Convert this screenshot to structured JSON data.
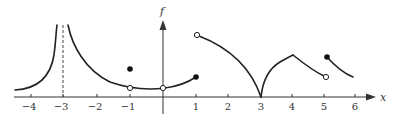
{
  "figure": {
    "function_label": "f",
    "x_axis_label": "x",
    "colors": {
      "curve": "#222222",
      "axis": "#333333",
      "asymptote": "#444444",
      "open_dot_fill": "#ffffff"
    }
  },
  "axis": {
    "x_ticks": [
      "−4",
      "−3",
      "−2",
      "−1",
      "1",
      "2",
      "3",
      "4",
      "5",
      "6"
    ],
    "x_range": [
      -4.5,
      6.8
    ]
  },
  "graph": {
    "vertical_asymptote": {
      "x": -3,
      "style": "dashed"
    },
    "points": [
      {
        "x": -1,
        "type": "open",
        "description": "hole on curve at x=-1"
      },
      {
        "x": -1,
        "type": "filled",
        "description": "defined value above curve at x=-1"
      },
      {
        "x": 0,
        "type": "open",
        "description": "hole at x=0 on the axis"
      },
      {
        "x": 1,
        "type": "filled",
        "description": "endpoint of left parabola at x=1"
      },
      {
        "x": 1,
        "type": "open",
        "description": "open start of descending arc at x=1"
      },
      {
        "x": 5,
        "type": "open",
        "description": "open end of segment at x=5"
      },
      {
        "x": 5,
        "type": "filled",
        "description": "closed start of last segment at x=5"
      }
    ],
    "features": [
      "vertical asymptote at x=-3",
      "removable discontinuity at x=-1",
      "hole at x=0",
      "jump discontinuity at x=1",
      "cusp at x=3 touching the x-axis",
      "corner at x=4",
      "jump discontinuity at x=5"
    ]
  }
}
